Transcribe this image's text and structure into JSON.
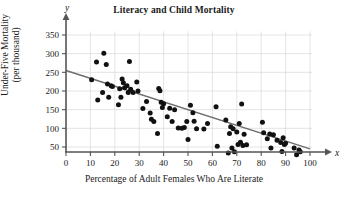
{
  "chart_data": {
    "type": "scatter",
    "title": "Literacy and Child Mortality",
    "xlabel": "Percentage of Adult Females Who Are Literate",
    "ylabel_line1": "Under-Five Mortality",
    "ylabel_line2": "(per thousand)",
    "x_axis_symbol": "x",
    "y_axis_symbol": "y",
    "xlim": [
      0,
      100
    ],
    "ylim": [
      0,
      360
    ],
    "xticks": [
      0,
      10,
      20,
      30,
      40,
      50,
      60,
      70,
      80,
      90,
      100
    ],
    "yticks": [
      50,
      100,
      150,
      200,
      250,
      300,
      350
    ],
    "grid": true,
    "legend": "none",
    "point_color": "#111111",
    "trendline_color": "#6e6e6e",
    "grid_color": "#d8d8d8",
    "axis_color": "#555555",
    "trendline": {
      "label": "least-squares regression line",
      "x_start": 0,
      "y_start": 255,
      "x_end": 100,
      "y_end": 45
    },
    "points": [
      [
        10.5,
        230
      ],
      [
        12.5,
        278
      ],
      [
        13.0,
        176
      ],
      [
        15.5,
        301
      ],
      [
        15.0,
        196
      ],
      [
        16.5,
        271
      ],
      [
        17.0,
        219
      ],
      [
        17.5,
        183
      ],
      [
        18.5,
        214
      ],
      [
        19.0,
        212
      ],
      [
        21.5,
        163
      ],
      [
        22.0,
        206
      ],
      [
        22.5,
        183
      ],
      [
        23.0,
        232
      ],
      [
        23.5,
        222
      ],
      [
        24.0,
        209
      ],
      [
        25.0,
        214
      ],
      [
        25.5,
        196
      ],
      [
        26.0,
        279
      ],
      [
        26.5,
        205
      ],
      [
        27.5,
        196
      ],
      [
        29.0,
        224
      ],
      [
        29.5,
        200
      ],
      [
        31.5,
        153
      ],
      [
        33.0,
        172
      ],
      [
        34.5,
        141
      ],
      [
        35.0,
        124
      ],
      [
        36.0,
        118
      ],
      [
        37.5,
        86
      ],
      [
        38.0,
        207
      ],
      [
        38.5,
        201
      ],
      [
        39.0,
        170
      ],
      [
        39.5,
        156
      ],
      [
        40.0,
        166
      ],
      [
        41.5,
        131
      ],
      [
        42.5,
        154
      ],
      [
        43.5,
        118
      ],
      [
        44.5,
        150
      ],
      [
        46.0,
        101
      ],
      [
        47.5,
        100
      ],
      [
        48.5,
        102
      ],
      [
        49.5,
        118
      ],
      [
        50.0,
        70
      ],
      [
        51.0,
        162
      ],
      [
        52.0,
        142
      ],
      [
        52.5,
        119
      ],
      [
        53.5,
        99
      ],
      [
        56.5,
        98
      ],
      [
        58.0,
        113
      ],
      [
        61.5,
        158
      ],
      [
        62.0,
        52
      ],
      [
        65.5,
        122
      ],
      [
        66.5,
        34
      ],
      [
        67.0,
        86
      ],
      [
        67.5,
        104
      ],
      [
        68.0,
        47
      ],
      [
        68.5,
        99
      ],
      [
        69.0,
        37
      ],
      [
        70.0,
        90
      ],
      [
        70.5,
        57
      ],
      [
        71.0,
        113
      ],
      [
        71.5,
        63
      ],
      [
        72.0,
        165
      ],
      [
        72.5,
        54
      ],
      [
        73.0,
        84
      ],
      [
        74.0,
        56
      ],
      [
        80.5,
        116
      ],
      [
        81.0,
        88
      ],
      [
        82.5,
        72
      ],
      [
        83.5,
        85
      ],
      [
        84.0,
        47
      ],
      [
        85.0,
        83
      ],
      [
        86.5,
        68
      ],
      [
        88.0,
        62
      ],
      [
        88.5,
        38
      ],
      [
        89.0,
        75
      ],
      [
        89.5,
        57
      ],
      [
        90.0,
        60
      ],
      [
        93.5,
        47
      ],
      [
        94.5,
        29
      ],
      [
        95.5,
        42
      ],
      [
        96.0,
        37
      ]
    ]
  }
}
